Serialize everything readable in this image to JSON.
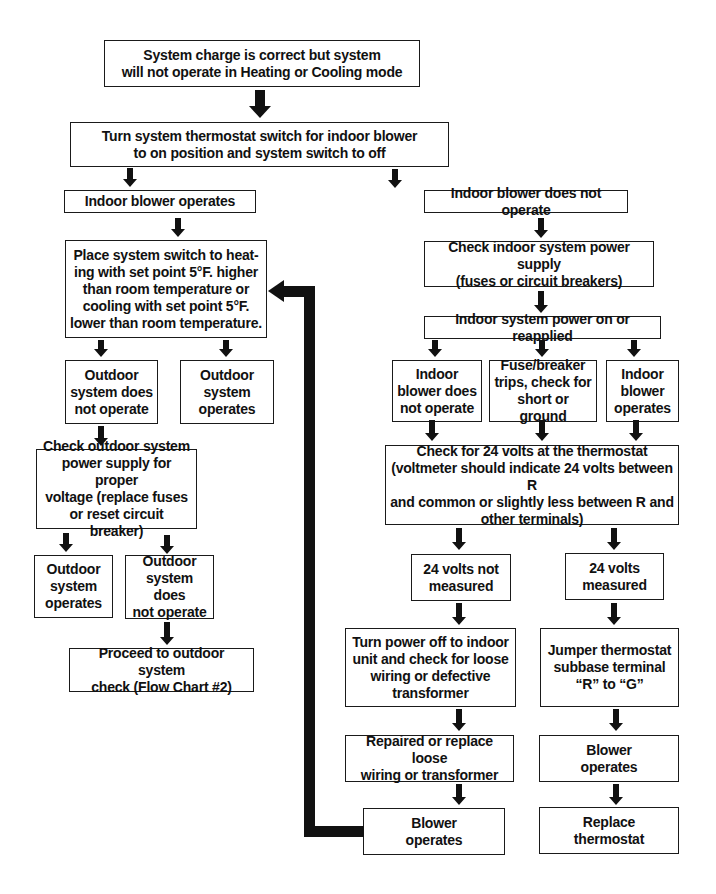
{
  "flowchart": {
    "start": "System charge is correct but system\nwill not operate in Heating or Cooling mode",
    "step1": "Turn system thermostat switch for indoor blower\nto on position and system switch to off",
    "left": {
      "branch": "Indoor blower operates",
      "place_switch": "Place system switch to heat-\ning with set point 5°F. higher\nthan room temperature or\ncooling with set point 5°F.\nlower than room temperature.",
      "outdoor_not_operate": "Outdoor\nsystem does\nnot operate",
      "outdoor_operates": "Outdoor\nsystem\noperates",
      "check_outdoor_power": "Check outdoor system\npower supply for proper\nvoltage (replace fuses\nor reset circuit breaker)",
      "outdoor_operates_2": "Outdoor\nsystem\noperates",
      "outdoor_not_operate_2": "Outdoor\nsystem does\nnot operate",
      "proceed": "Proceed to outdoor system\ncheck (Flow Chart #2)"
    },
    "right": {
      "branch": "Indoor blower does not operate",
      "check_indoor_power": "Check indoor system power supply\n(fuses or circuit breakers)",
      "power_on": "Indoor system power on or reapplied",
      "blower_not_operate": "Indoor\nblower does\nnot operate",
      "fuse_trips": "Fuse/breaker\ntrips, check for\nshort or ground",
      "blower_operates": "Indoor\nblower\noperates",
      "check_24v": "Check for 24 volts at the thermostat\n(voltmeter should indicate 24 volts between R\nand common or slightly less between R and\nother terminals)",
      "not_measured": "24 volts not\nmeasured",
      "measured": "24 volts\nmeasured",
      "turn_power_off": "Turn power off to indoor\nunit and check for loose\nwiring or defective\ntransformer",
      "jumper": "Jumper thermostat\nsubbase terminal\n“R” to “G”\n",
      "repaired": "Repaired or replace loose\nwiring or transformer",
      "blower_operates_r": "Blower\noperates",
      "blower_operates_l": "Blower\noperates",
      "replace_thermostat": "Replace\nthermostat"
    }
  },
  "colors": {
    "line": "#111111",
    "box_border": "#1a1a1a",
    "background": "#ffffff"
  }
}
